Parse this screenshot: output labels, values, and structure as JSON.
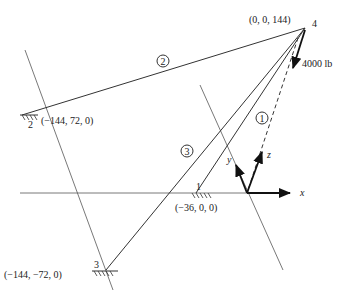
{
  "diagram": {
    "points": [
      {
        "id": "1",
        "coords": "(−36, 0, 0)"
      },
      {
        "id": "2",
        "coords": "(−144, 72, 0)"
      },
      {
        "id": "3",
        "coords": "(−144, −72, 0)"
      },
      {
        "id": "4",
        "coords": "(0, 0, 144)"
      }
    ],
    "members": [
      "1",
      "2",
      "3"
    ],
    "load": "4000 lb",
    "axes": {
      "x": "x",
      "y": "y",
      "z": "z"
    }
  }
}
